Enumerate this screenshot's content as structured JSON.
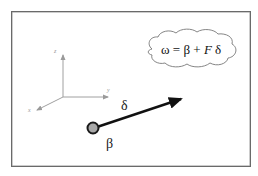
{
  "diagram": {
    "equation": {
      "omega": "ω",
      "equals": " = ",
      "beta": "β",
      "plus": " + ",
      "F": "F",
      "delta": " δ"
    },
    "axes": {
      "z_label": "z",
      "y_label": "y",
      "x_label": "x"
    },
    "vector_label": "δ",
    "point_label": "β",
    "colors": {
      "frame": "#6a6a6a",
      "axes": "#a0a0a0",
      "vector": "#111111",
      "point_fill": "#a8a8a8",
      "point_stroke": "#1a1a1a",
      "cloud_stroke": "#777777"
    }
  }
}
